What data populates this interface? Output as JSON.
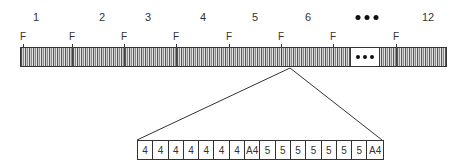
{
  "diagram": {
    "frame_numbers": [
      {
        "label": "1",
        "x": 36
      },
      {
        "label": "2",
        "x": 102
      },
      {
        "label": "3",
        "x": 148
      },
      {
        "label": "4",
        "x": 203
      },
      {
        "label": "5",
        "x": 255
      },
      {
        "label": "6",
        "x": 308
      },
      {
        "label": "12",
        "x": 428
      }
    ],
    "ellipsis_top_x": 367,
    "f_markers": [
      {
        "label": "F",
        "x": 23
      },
      {
        "label": "F",
        "x": 72
      },
      {
        "label": "F",
        "x": 124
      },
      {
        "label": "F",
        "x": 176
      },
      {
        "label": "F",
        "x": 229
      },
      {
        "label": "F",
        "x": 281
      },
      {
        "label": "F",
        "x": 333
      },
      {
        "label": "F",
        "x": 396
      }
    ],
    "expanded_cells": [
      "4",
      "4",
      "4",
      "4",
      "4",
      "4",
      "4",
      "A4",
      "5",
      "5",
      "5",
      "5",
      "5",
      "5",
      "5",
      "A4"
    ],
    "colors": {
      "line": "#333333",
      "bar_dark": "#555555",
      "bar_light": "#cfcfcf"
    }
  }
}
